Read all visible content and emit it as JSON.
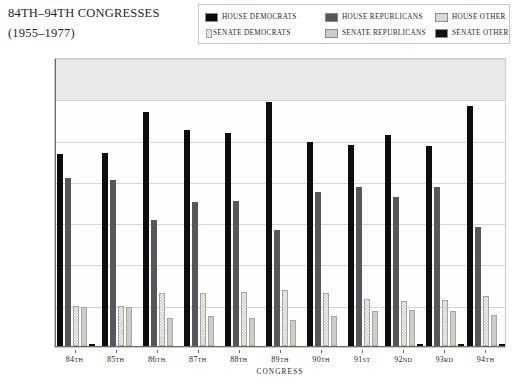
{
  "title": {
    "line1_prefix": "84",
    "line1": "84TH–94TH CONGRESSES",
    "line2": "(1955–1977)"
  },
  "legend": {
    "rows": [
      [
        {
          "label": "HOUSE DEMOCRATS",
          "color": "#0d0d0d",
          "name": "house-democrats"
        },
        {
          "label": "HOUSE REPUBLICANS",
          "color": "#58565a",
          "name": "house-republicans"
        },
        {
          "label": "HOUSE OTHER",
          "color": "#d9d9d9",
          "name": "house-other"
        }
      ],
      [
        {
          "label": "SENATE DEMOCRATS",
          "color": "#d2d0cb",
          "name": "senate-democrats"
        },
        {
          "label": "SENATE REPUBLICANS",
          "color": "#cfcdc8",
          "name": "senate-republicans"
        },
        {
          "label": "SENATE OTHER",
          "color": "#111111",
          "name": "senate-other"
        }
      ]
    ]
  },
  "chart_data": {
    "type": "bar",
    "title": "84TH–94TH CONGRESSES (1955–1977)",
    "xlabel": "CONGRESS",
    "ylabel": "NUMBER OF MEMBERS",
    "ylim": [
      0,
      350
    ],
    "yticks": [
      0,
      50,
      100,
      150,
      200,
      250,
      300,
      350
    ],
    "grid": true,
    "legend_position": "top-right",
    "categories": [
      "84TH",
      "85TH",
      "86TH",
      "87TH",
      "88TH",
      "89TH",
      "90TH",
      "91ST",
      "92ND",
      "93RD",
      "94TH"
    ],
    "series": [
      {
        "name": "HOUSE DEMOCRATS",
        "color": "#0d0d0d",
        "values": [
          232,
          234,
          283,
          262,
          258,
          295,
          247,
          243,
          255,
          242,
          291
        ]
      },
      {
        "name": "HOUSE REPUBLICANS",
        "color": "#58565a",
        "values": [
          203,
          201,
          153,
          175,
          176,
          140,
          187,
          192,
          180,
          192,
          144
        ]
      },
      {
        "name": "HOUSE OTHER",
        "color": "#d9d9d9",
        "values": [
          0,
          0,
          0,
          0,
          0,
          0,
          0,
          0,
          0,
          0,
          0
        ]
      },
      {
        "name": "SENATE DEMOCRATS",
        "color": "#d2d0cb",
        "values": [
          48,
          49,
          64,
          64,
          66,
          68,
          64,
          57,
          54,
          56,
          60
        ]
      },
      {
        "name": "SENATE REPUBLICANS",
        "color": "#cfcdc8",
        "values": [
          47,
          47,
          34,
          36,
          34,
          32,
          36,
          43,
          44,
          42,
          37
        ]
      },
      {
        "name": "SENATE OTHER",
        "color": "#111111",
        "values": [
          1,
          0,
          0,
          0,
          0,
          0,
          0,
          0,
          2,
          2,
          2
        ]
      }
    ]
  },
  "axes": {
    "ytick_labels": [
      "0",
      "50",
      "100",
      "150",
      "200",
      "250",
      "300",
      "350"
    ],
    "xlabel_text": "CONGRESS",
    "ylabel_text": "NUMBER OF MEMBERS"
  }
}
